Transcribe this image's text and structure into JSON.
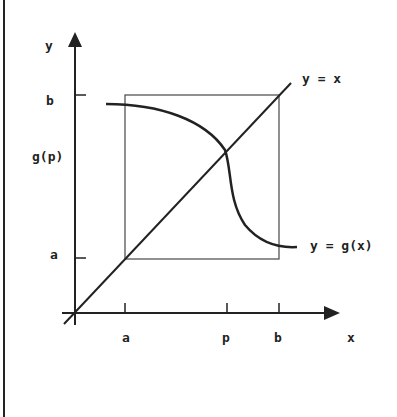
{
  "diagram": {
    "axes": {
      "x_label": "x",
      "y_label": "y"
    },
    "x_ticks": [
      "a",
      "p",
      "b"
    ],
    "y_ticks": [
      "b",
      "g(p)",
      "a"
    ],
    "curves": [
      {
        "name": "identity-line",
        "label": "y = x"
      },
      {
        "name": "g-curve",
        "label": "y = g(x)"
      }
    ],
    "box": "square [a,b] × [a,b]",
    "colors": {
      "ink": "#222222",
      "box": "#555555",
      "background": "#ffffff"
    }
  }
}
